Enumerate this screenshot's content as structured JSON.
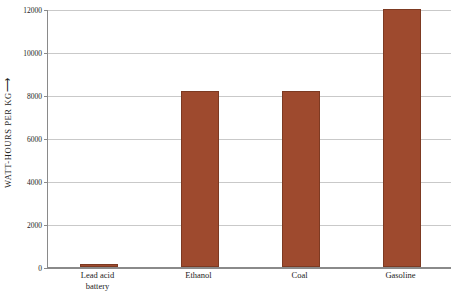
{
  "chart_data": {
    "type": "bar",
    "title": "",
    "xlabel": "",
    "ylabel": "WATT-HOURS PER KG",
    "ylabel_arrow": "⟶",
    "categories": [
      "Lead acid battery",
      "Ethanol",
      "Coal",
      "Gasoline"
    ],
    "values": [
      150,
      8200,
      8200,
      12000
    ],
    "ylim": [
      0,
      12000
    ],
    "yticks": [
      0,
      2000,
      4000,
      6000,
      8000,
      10000,
      12000
    ],
    "ytick_labels": [
      "0",
      "2000",
      "4000",
      "6000",
      "8000",
      "10000",
      "12000"
    ],
    "grid": true,
    "legend": "none",
    "bar_color": "#9e4a2e",
    "bar_border_color": "#7d3a22",
    "axis_color": "#8a8a8a",
    "grid_color": "#c9c9c9",
    "background": "#ffffff",
    "category_lines": [
      [
        "Lead acid",
        "battery"
      ],
      [
        "Ethanol"
      ],
      [
        "Coal"
      ],
      [
        "Gasoline"
      ]
    ]
  }
}
